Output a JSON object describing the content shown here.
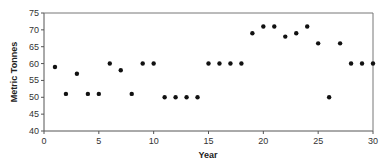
{
  "chart_data": {
    "type": "scatter",
    "title": "",
    "xlabel": "Year",
    "ylabel": "Metric Tonnes",
    "xlim": [
      0,
      30
    ],
    "ylim": [
      40,
      75
    ],
    "x_ticks": [
      0,
      5,
      10,
      15,
      20,
      25,
      30
    ],
    "y_ticks": [
      40,
      45,
      50,
      55,
      60,
      65,
      70,
      75
    ],
    "grid": false,
    "legend": null,
    "x": [
      1,
      2,
      3,
      4,
      5,
      6,
      7,
      8,
      9,
      10,
      11,
      12,
      13,
      14,
      15,
      16,
      17,
      18,
      19,
      20,
      21,
      22,
      23,
      24,
      25,
      26,
      27,
      28,
      29,
      30
    ],
    "y": [
      59,
      51,
      57,
      51,
      51,
      60,
      58,
      51,
      60,
      60,
      50,
      50,
      50,
      50,
      60,
      60,
      60,
      60,
      69,
      71,
      71,
      68,
      69,
      71,
      66,
      50,
      66,
      60,
      60,
      60
    ],
    "marker_color": "#111111"
  }
}
